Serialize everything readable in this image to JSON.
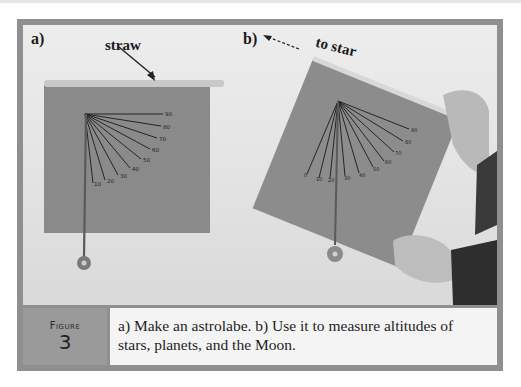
{
  "figure": {
    "label": "Figure",
    "number": "3",
    "caption": "a) Make an astrolabe. b) Use it to measure altitudes of stars, planets, and the Moon."
  },
  "panel_a": {
    "label": "a)",
    "annotation": "straw",
    "scale_marks": [
      "90",
      "80",
      "70",
      "60",
      "50",
      "40",
      "30",
      "20",
      "10"
    ]
  },
  "panel_b": {
    "label": "b)",
    "annotation": "to star",
    "scale_marks": [
      "90",
      "80",
      "70",
      "60",
      "50",
      "40",
      "30",
      "20",
      "10",
      "0"
    ]
  },
  "colors": {
    "frame": "#8f8f8f",
    "caption_label_bg": "#9a9a9a",
    "caption_text_bg": "#f4f4f4",
    "board": "#8c8c8c",
    "straw": "#c8c8c8"
  }
}
